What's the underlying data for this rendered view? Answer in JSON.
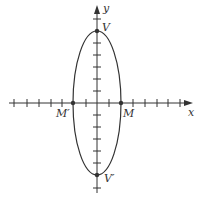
{
  "diagram": {
    "type": "ellipse-on-axes",
    "axes": {
      "x_label": "x",
      "y_label": "y",
      "tick_spacing_units": 1,
      "x_ticks": [
        -7,
        -6,
        -5,
        -4,
        -3,
        -2,
        -1,
        1,
        2,
        3,
        4,
        5,
        6,
        7
      ],
      "y_ticks": [
        -7,
        -6,
        -5,
        -4,
        -3,
        -2,
        -1,
        1,
        2,
        3,
        4,
        5,
        6
      ]
    },
    "ellipse": {
      "center": [
        0,
        0
      ],
      "semi_major_axis": 6,
      "semi_minor_axis": 2,
      "orientation": "vertical"
    },
    "points": [
      {
        "label": "V",
        "coords": [
          0,
          6
        ]
      },
      {
        "label": "V′",
        "coords": [
          0,
          -6
        ]
      },
      {
        "label": "M",
        "coords": [
          2,
          0
        ]
      },
      {
        "label": "M′",
        "coords": [
          -2,
          0
        ]
      }
    ],
    "colors": {
      "stroke": "#333333",
      "background": "#ffffff"
    }
  }
}
